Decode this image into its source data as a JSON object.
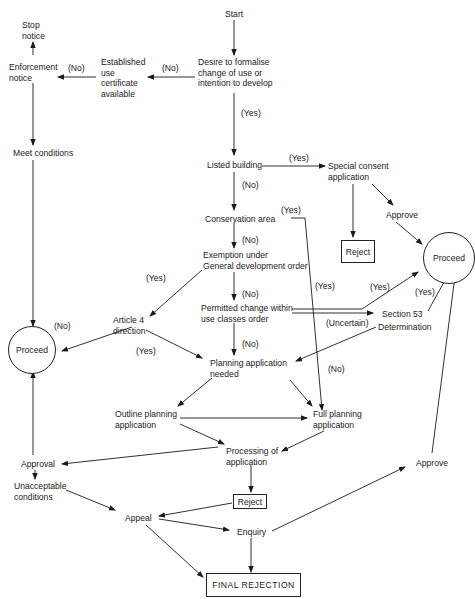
{
  "header_cut_text": "",
  "nodes": {
    "start": "Start",
    "desire": "Desire to formalise\nchange of use or\nintention to develop",
    "established": "Established\nuse\ncertificate\navailable",
    "enforcement": "Enforcement\nnotice",
    "stop_notice": "Stop\nnotice",
    "meet_conditions": "Meet conditions",
    "listed_building": "Listed building",
    "special_consent": "Special consent\napplication",
    "approve_top": "Approve",
    "reject_top": "Reject",
    "proceed_right": "Proceed",
    "conservation": "Conservation area",
    "exemption": "Exemption under\nGeneral development order",
    "article4": "Article 4\ndirection",
    "proceed_left": "Proceed",
    "permitted": "Permitted change within\nuse classes order",
    "section53": "Section 53",
    "determination": "Determination",
    "planning_needed": "Planning application\nneeded",
    "outline": "Outline planning\napplication",
    "full": "Full planning\napplication",
    "processing": "Processing of\napplication",
    "approval": "Approval",
    "unacceptable": "Unacceptable\nconditions",
    "reject_mid": "Reject",
    "appeal": "Appeal",
    "enquiry": "Enquiry",
    "approve_bottom": "Approve",
    "final_rejection": "FINAL REJECTION"
  },
  "conditions": {
    "no_desire_est": "(No)",
    "no_est_enf": "(No)",
    "yes_desire_listed": "(Yes)",
    "yes_listed_special": "(Yes)",
    "no_listed_cons": "(No)",
    "yes_cons": "(Yes)",
    "no_cons_exempt": "(No)",
    "yes_exempt_art4": "(Yes)",
    "no_exempt_perm": "(No)",
    "no_art4": "(No)",
    "yes_art4_planning": "(Yes)",
    "yes_cons_full": "(Yes)",
    "yes_perm_proceed": "(Yes)",
    "yes_s53": "(Yes)",
    "uncertain": "(Uncertain)",
    "no_perm_planning": "(No)",
    "no_s53_full": "(No)"
  }
}
